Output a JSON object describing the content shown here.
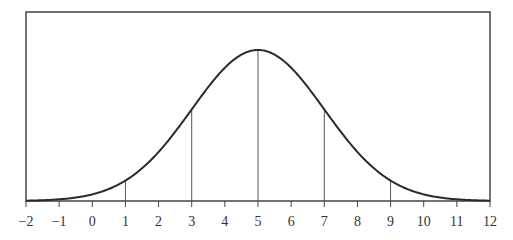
{
  "chart_data": {
    "type": "line",
    "title": "",
    "xlabel": "",
    "ylabel": "",
    "mean": 5,
    "sd": 2,
    "xlim": [
      -2,
      12
    ],
    "x_ticks": [
      "-2",
      "-1",
      "0",
      "1",
      "2",
      "3",
      "4",
      "5",
      "6",
      "7",
      "8",
      "9",
      "10",
      "11",
      "12"
    ],
    "vertical_lines_at": [
      1,
      3,
      5,
      7,
      9
    ],
    "grid": false,
    "legend": false
  },
  "colors": {
    "curve": "#2a2a2a",
    "frame": "#444444",
    "lines": "#555555"
  }
}
